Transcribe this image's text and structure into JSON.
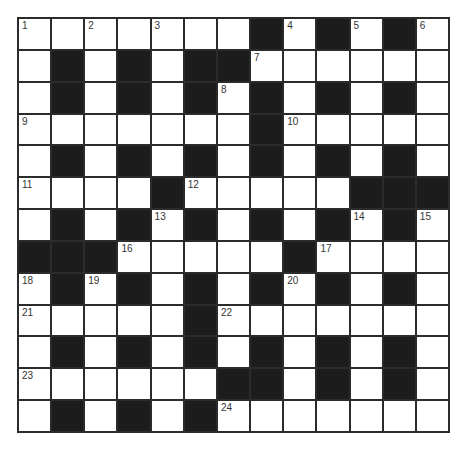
{
  "puzzle": {
    "rows": 13,
    "cols": 13,
    "grid": [
      "WWWWWWWBWBWBW",
      "WBWBWBBWWWWWW",
      "WBWBWBWBWBWBW",
      "WWWWWWWBWWWWW",
      "WBWBWBWBWBWBW",
      "WWWWBWWWWWBBB",
      "WBWBWBWBWBWBW",
      "BBBWWWWWBWWWW",
      "WBWBWBWBWBWBW",
      "WWWWWBWWWWWWW",
      "WBWBWBWBWBWBW",
      "WWWWWWBBWBWBW",
      "WBWBWBWWWWWWW"
    ],
    "numbers": [
      {
        "row": 0,
        "col": 0,
        "n": "1"
      },
      {
        "row": 0,
        "col": 2,
        "n": "2"
      },
      {
        "row": 0,
        "col": 4,
        "n": "3"
      },
      {
        "row": 0,
        "col": 8,
        "n": "4"
      },
      {
        "row": 0,
        "col": 10,
        "n": "5"
      },
      {
        "row": 0,
        "col": 12,
        "n": "6"
      },
      {
        "row": 1,
        "col": 7,
        "n": "7"
      },
      {
        "row": 2,
        "col": 6,
        "n": "8"
      },
      {
        "row": 3,
        "col": 0,
        "n": "9"
      },
      {
        "row": 3,
        "col": 8,
        "n": "10"
      },
      {
        "row": 5,
        "col": 0,
        "n": "11"
      },
      {
        "row": 5,
        "col": 5,
        "n": "12"
      },
      {
        "row": 6,
        "col": 4,
        "n": "13"
      },
      {
        "row": 6,
        "col": 10,
        "n": "14"
      },
      {
        "row": 6,
        "col": 12,
        "n": "15"
      },
      {
        "row": 7,
        "col": 3,
        "n": "16"
      },
      {
        "row": 7,
        "col": 9,
        "n": "17"
      },
      {
        "row": 8,
        "col": 0,
        "n": "18"
      },
      {
        "row": 8,
        "col": 2,
        "n": "19"
      },
      {
        "row": 8,
        "col": 8,
        "n": "20"
      },
      {
        "row": 9,
        "col": 0,
        "n": "21"
      },
      {
        "row": 9,
        "col": 6,
        "n": "22"
      },
      {
        "row": 11,
        "col": 0,
        "n": "23"
      },
      {
        "row": 12,
        "col": 6,
        "n": "24"
      }
    ],
    "colors": {
      "block": "#1c1c1c",
      "cell": "#ffffff",
      "line": "#2b2b2b",
      "number": "#333333"
    }
  }
}
